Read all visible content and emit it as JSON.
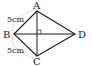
{
  "diagram": {
    "type": "kite",
    "vertices": {
      "A": {
        "label": "A",
        "x": 37,
        "y": 11
      },
      "B": {
        "label": "B",
        "x": 14,
        "y": 34
      },
      "C": {
        "label": "C",
        "x": 37,
        "y": 56
      },
      "D": {
        "label": "D",
        "x": 75,
        "y": 34
      }
    },
    "measurements": {
      "AB": "5cm",
      "BC": "5cm"
    },
    "right_angle_at_diagonal_intersection": true,
    "line_color": "#1a1a1a",
    "dim_arc_color": "#999999"
  }
}
